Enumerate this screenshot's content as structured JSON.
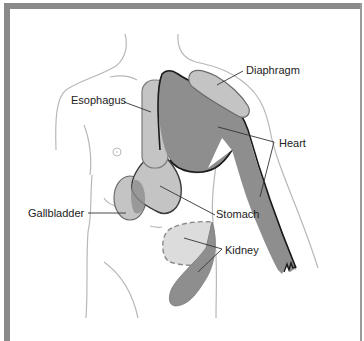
{
  "figure": {
    "labels": {
      "diaphragm": "Diaphragm",
      "esophagus": "Esophagus",
      "heart": "Heart",
      "gallbladder": "Gallbladder",
      "stomach": "Stomach",
      "kidney": "Kidney"
    },
    "colors": {
      "border": "#8a8a8a",
      "body_outline": "#b8b8b8",
      "heart_fill": "#8e8e8e",
      "light_fill": "#c4c4c4",
      "lighter_fill": "#dcdcdc",
      "outline_dark": "#1a1a1a",
      "outline_mid": "#6a6a6a",
      "leader_line": "#333333"
    }
  }
}
